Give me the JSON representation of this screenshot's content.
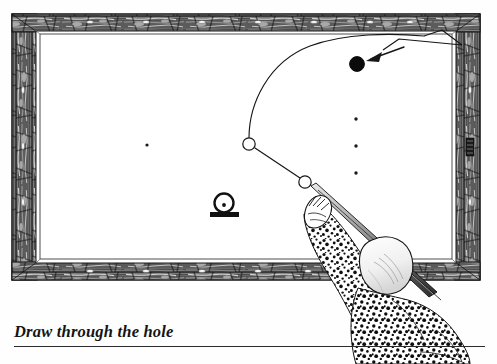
{
  "figure": {
    "caption": "Draw through the hole",
    "title": "Draw through the hole",
    "kind": "billiards-instructional-diagram",
    "has_caption_rule": true
  },
  "colors": {
    "ink": "#161616",
    "paper": "#ffffff",
    "frame_dark": "#2c2c2c",
    "frame_mid": "#6a6a6a",
    "frame_light": "#e8e8e8",
    "ball_solid": "#0b0b0b",
    "cloth": "#ffffff"
  },
  "table": {
    "label": "billiard-table",
    "outer_frame": {
      "x": 12,
      "y": 14,
      "width": 468,
      "height": 266
    },
    "rail_inner": {
      "x": 36,
      "y": 30,
      "width": 420,
      "height": 234
    },
    "bed": {
      "x": 38,
      "y": 31,
      "width": 416,
      "height": 228
    },
    "rail_markers_top": 7,
    "rail_markers_bottom": 7,
    "rail_markers_left": 3,
    "rail_markers_right": 3
  },
  "spots": [
    {
      "name": "spot-left",
      "x": 147,
      "y": 145
    },
    {
      "name": "spot-right-upper",
      "x": 356,
      "y": 119
    },
    {
      "name": "spot-right-middle",
      "x": 356,
      "y": 146
    },
    {
      "name": "spot-right-lower",
      "x": 356,
      "y": 173
    }
  ],
  "balls": [
    {
      "name": "cue-ball-at-rest",
      "x": 305,
      "y": 182,
      "r": 6.2,
      "fill": "white",
      "stroke": "#161616"
    },
    {
      "name": "cue-ball-contact-point",
      "x": 249,
      "y": 144,
      "r": 6.2,
      "fill": "white",
      "stroke": "#161616"
    },
    {
      "name": "object-ball",
      "x": 357,
      "y": 64,
      "r": 7.4,
      "fill": "#0b0b0b",
      "stroke": "#0b0b0b"
    }
  ],
  "hole_marker": {
    "name": "hole-obstacle",
    "ring_cx": 224,
    "ring_cy": 203,
    "ring_r": 9.5,
    "dot_cx": 224,
    "dot_cy": 205,
    "dot_r": 1.9,
    "base": {
      "x": 210,
      "y": 212,
      "width": 29,
      "height": 5
    }
  },
  "paths": {
    "draw_curve_label": "draw-shot-trajectory",
    "cue_line_label": "cue-ball-travel-line",
    "chevron_label": "rebound-chevron",
    "arrow_label": "target-arrow"
  },
  "player": {
    "label": "player-with-cue",
    "cue_label": "cue-stick",
    "bridge_hand_label": "bridge-hand",
    "sleeve_label": "patterned-sleeve",
    "head_label": "player-head",
    "jacket_label": "patterned-jacket"
  }
}
